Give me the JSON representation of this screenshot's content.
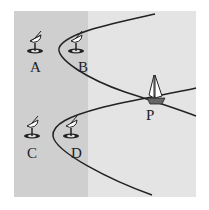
{
  "diagram": {
    "colors": {
      "background": "#ffffff",
      "region_light": "#e4e4e4",
      "region_dark": "#cfcfcf",
      "curve": "#222222"
    },
    "stations": [
      {
        "id": "A",
        "label": "A",
        "icon": "satellite-dish-icon",
        "x": 35,
        "y": 45
      },
      {
        "id": "B",
        "label": "B",
        "icon": "satellite-dish-icon",
        "x": 76,
        "y": 45
      },
      {
        "id": "C",
        "label": "C",
        "icon": "satellite-dish-icon",
        "x": 32,
        "y": 130
      },
      {
        "id": "D",
        "label": "D",
        "icon": "satellite-dish-icon",
        "x": 71,
        "y": 130
      }
    ],
    "point": {
      "label": "P",
      "icon": "sailboat-icon",
      "x": 155,
      "y": 99
    }
  }
}
